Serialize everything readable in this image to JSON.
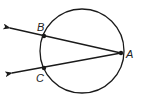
{
  "diagram": {
    "type": "geometry-circle-secants",
    "colors": {
      "stroke": "#1a1a1a",
      "background": "#ffffff"
    },
    "circle": {
      "cx": 82,
      "cy": 51,
      "r": 42
    },
    "points": [
      {
        "id": "A",
        "label": "A",
        "x": 121,
        "y": 53
      },
      {
        "id": "B",
        "label": "B",
        "x": 44,
        "y": 36
      },
      {
        "id": "C",
        "label": "C",
        "x": 44,
        "y": 68
      }
    ],
    "rays": [
      {
        "from": "A",
        "through": "B",
        "label": "ray AB"
      },
      {
        "from": "A",
        "through": "C",
        "label": "ray AC"
      }
    ]
  }
}
